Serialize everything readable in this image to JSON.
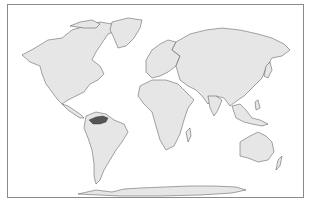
{
  "map": {
    "type": "choropleth world map",
    "projection": "equirectangular",
    "colors": {
      "land": "#e6e6e6",
      "border": "#3a3a3a",
      "ocean": "#ffffff",
      "highlight": "#555555",
      "frame": "#8a8a8a"
    },
    "highlighted_regions": [
      {
        "name": "Venezuela",
        "color": "#555555"
      }
    ],
    "regions": [
      "North America",
      "Greenland",
      "South America",
      "Europe",
      "Africa",
      "Asia",
      "Australia",
      "Antarctica"
    ]
  }
}
